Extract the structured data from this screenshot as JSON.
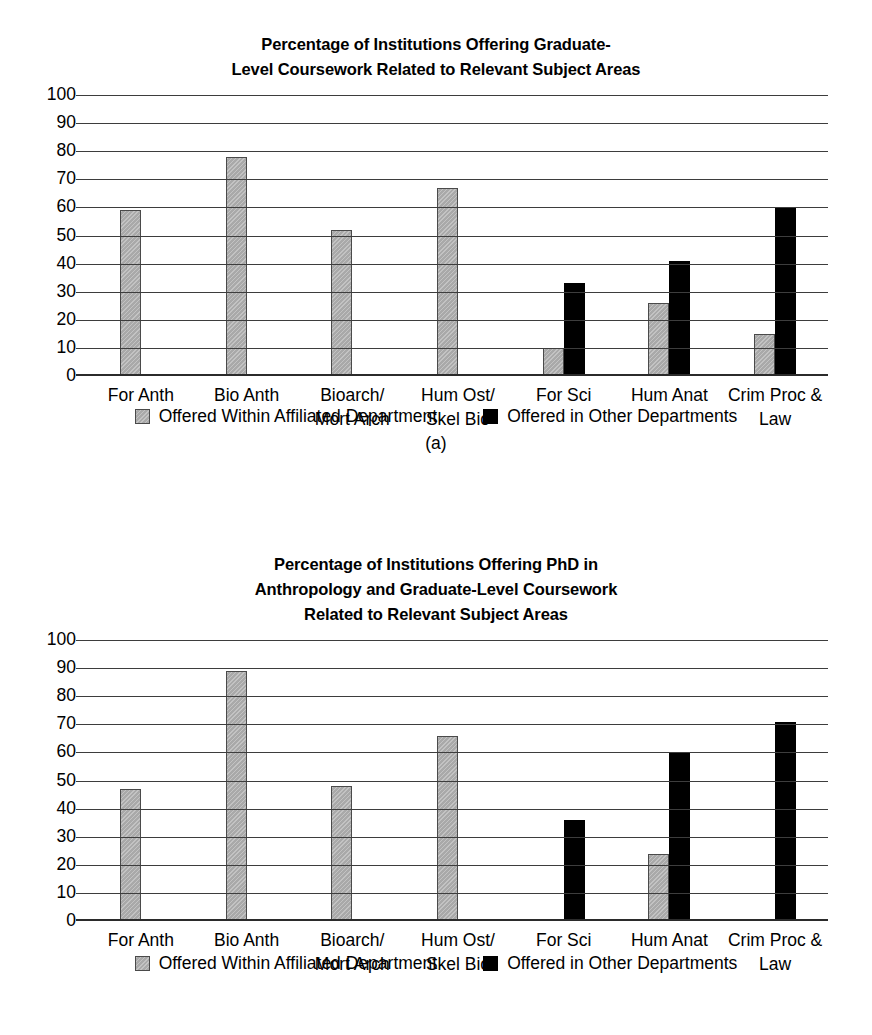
{
  "figures": [
    {
      "id": "a",
      "caption": "(a)",
      "title_line1": "Percentage of Institutions Offering Graduate-",
      "title_line2": "Level Coursework Related to Relevant Subject Areas",
      "title_line3": "",
      "legend": [
        {
          "label": "Offered Within Affiliated Department",
          "swatch": "gray-swatch-icon",
          "color": "#a9a9a9"
        },
        {
          "label": "Offered in Other Departments",
          "swatch": "black-swatch-icon",
          "color": "#000000"
        }
      ],
      "chart_data": {
        "type": "bar",
        "title": "Percentage of Institutions Offering Graduate-Level Coursework Related to Relevant Subject Areas",
        "xlabel": "",
        "ylabel": "",
        "ylim": [
          0,
          100
        ],
        "yticks": [
          0,
          10,
          20,
          30,
          40,
          50,
          60,
          70,
          80,
          90,
          100
        ],
        "ytick_labels": [
          "0",
          "10",
          "20",
          "30",
          "40",
          "50",
          "60",
          "70",
          "80",
          "90",
          "100"
        ],
        "grid": true,
        "legend_position": "bottom",
        "categories": [
          "For Anth",
          "Bio Anth",
          "Bioarch/\nMort Arch",
          "Hum Ost/\nSkel Bio",
          "For Sci",
          "Hum Anat",
          "Crim Proc &\nLaw"
        ],
        "series": [
          {
            "name": "Offered Within Affiliated Department",
            "color": "#a9a9a9",
            "values": [
              59,
              78,
              52,
              67,
              10,
              26,
              15
            ]
          },
          {
            "name": "Offered in Other Departments",
            "color": "#000000",
            "values": [
              null,
              null,
              null,
              null,
              33,
              41,
              60
            ]
          }
        ]
      }
    },
    {
      "id": "b",
      "caption": "",
      "title_line1": "Percentage of Institutions Offering PhD in",
      "title_line2": "Anthropology and Graduate-Level Coursework",
      "title_line3": "Related to Relevant Subject Areas",
      "legend": [
        {
          "label": "Offered Within Affiliated Department",
          "swatch": "gray-swatch-icon",
          "color": "#a9a9a9"
        },
        {
          "label": "Offered in Other Departments",
          "swatch": "black-swatch-icon",
          "color": "#000000"
        }
      ],
      "chart_data": {
        "type": "bar",
        "title": "Percentage of Institutions Offering PhD in Anthropology and Graduate-Level Coursework Related to Relevant Subject Areas",
        "xlabel": "",
        "ylabel": "",
        "ylim": [
          0,
          100
        ],
        "yticks": [
          0,
          10,
          20,
          30,
          40,
          50,
          60,
          70,
          80,
          90,
          100
        ],
        "ytick_labels": [
          "0",
          "10",
          "20",
          "30",
          "40",
          "50",
          "60",
          "70",
          "80",
          "90",
          "100"
        ],
        "grid": true,
        "legend_position": "bottom",
        "categories": [
          "For Anth",
          "Bio Anth",
          "Bioarch/\nMort Arch",
          "Hum Ost/\nSkel Bio",
          "For Sci",
          "Hum Anat",
          "Crim Proc &\nLaw"
        ],
        "series": [
          {
            "name": "Offered Within Affiliated Department",
            "color": "#a9a9a9",
            "values": [
              47,
              89,
              48,
              66,
              null,
              24,
              null
            ]
          },
          {
            "name": "Offered in Other Departments",
            "color": "#000000",
            "values": [
              null,
              null,
              null,
              null,
              36,
              60,
              71
            ]
          }
        ]
      }
    }
  ]
}
